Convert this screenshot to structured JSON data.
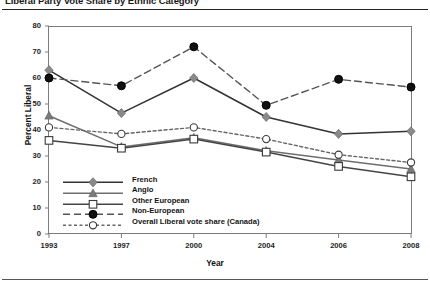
{
  "figure": {
    "title": "Liberal Party Vote Share by Ethnic Category",
    "y_axis_label": "Percent Liberal",
    "x_axis_label": "Year"
  },
  "chart_data": {
    "type": "line",
    "title": "Liberal Party Vote Share by Ethnic Category",
    "xlabel": "Year",
    "ylabel": "Percent Liberal",
    "categories": [
      "1993",
      "1997",
      "2000",
      "2004",
      "2006",
      "2008"
    ],
    "x": [
      1993,
      1997,
      2000,
      2004,
      2006,
      2008
    ],
    "xlim": [
      1993,
      2008
    ],
    "ylim": [
      0,
      80
    ],
    "yticks": [
      0,
      10,
      20,
      30,
      40,
      50,
      60,
      70,
      80
    ],
    "grid": false,
    "legend_position": "lower-left-inside",
    "series": [
      {
        "name": "French",
        "values": [
          63,
          46.5,
          60,
          45,
          38.5,
          39.5
        ],
        "marker": "filled-diamond",
        "line_style": "solid",
        "color": "#333333",
        "marker_color": "#8a8a8a"
      },
      {
        "name": "Anglo",
        "values": [
          45.5,
          33.5,
          37,
          32,
          28.5,
          25
        ],
        "marker": "filled-triangle",
        "line_style": "solid",
        "color": "#6e6e6e",
        "marker_color": "#7a7a7a"
      },
      {
        "name": "Other European",
        "values": [
          36,
          33,
          36.5,
          31.5,
          26,
          22
        ],
        "marker": "open-square",
        "line_style": "solid",
        "color": "#444444",
        "marker_color": "#ffffff"
      },
      {
        "name": "Non-European",
        "values": [
          60,
          57,
          72,
          49.5,
          59.5,
          56.5
        ],
        "marker": "filled-circle",
        "line_style": "dashed",
        "color": "#555555",
        "marker_color": "#111111"
      },
      {
        "name": "Overall Liberal vote share (Canada)",
        "values": [
          41,
          38.5,
          41,
          36.5,
          30.5,
          27.5
        ],
        "marker": "open-circle",
        "line_style": "dotted",
        "color": "#666666",
        "marker_color": "#ffffff"
      }
    ]
  },
  "y_ticks": [
    {
      "label": "80"
    },
    {
      "label": "70"
    },
    {
      "label": "60"
    },
    {
      "label": "50"
    },
    {
      "label": "40"
    },
    {
      "label": "30"
    },
    {
      "label": "20"
    },
    {
      "label": "10"
    },
    {
      "label": "0"
    }
  ],
  "x_ticks": [
    {
      "label": "1993"
    },
    {
      "label": "1997"
    },
    {
      "label": "2000"
    },
    {
      "label": "2004"
    },
    {
      "label": "2006"
    },
    {
      "label": "2008"
    }
  ],
  "legend": {
    "items": [
      {
        "label": "French"
      },
      {
        "label": "Anglo"
      },
      {
        "label": "Other European"
      },
      {
        "label": "Non-European"
      },
      {
        "label": "Overall Liberal vote share (Canada)"
      }
    ]
  }
}
